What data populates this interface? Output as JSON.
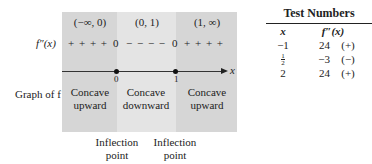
{
  "diagram": {
    "row_labels": {
      "second_derivative": "f″(x)",
      "graph": "Graph of f"
    },
    "intervals": [
      {
        "label": "(−∞, 0)",
        "signs": "+ + + +",
        "concavity_line1": "Concave",
        "concavity_line2": "upward",
        "shade": "dark"
      },
      {
        "label": "(0, 1)",
        "signs": "− − − −",
        "concavity_line1": "Concave",
        "concavity_line2": "downward",
        "shade": "light"
      },
      {
        "label": "(1, ∞)",
        "signs": "+ + + +",
        "concavity_line1": "Concave",
        "concavity_line2": "upward",
        "shade": "dark"
      }
    ],
    "zeros": [
      "0",
      "0"
    ],
    "critical_points": [
      "0",
      "1"
    ],
    "axis_label": "x",
    "inflection_labels": [
      {
        "line1": "Inflection",
        "line2": "point"
      },
      {
        "line1": "Inflection",
        "line2": "point"
      }
    ],
    "colors": {
      "dark_band": "#d6d6d6",
      "light_band": "#e4e4e4"
    }
  },
  "test_table": {
    "title": "Test Numbers",
    "headers": [
      "x",
      "f″(x)"
    ],
    "rows": [
      {
        "x": "−1",
        "value": "24",
        "sign": "(+)"
      },
      {
        "x_num": "1",
        "x_den": "2",
        "value": "−3",
        "sign": "(−)"
      },
      {
        "x": "2",
        "value": "24",
        "sign": "(+)"
      }
    ]
  }
}
